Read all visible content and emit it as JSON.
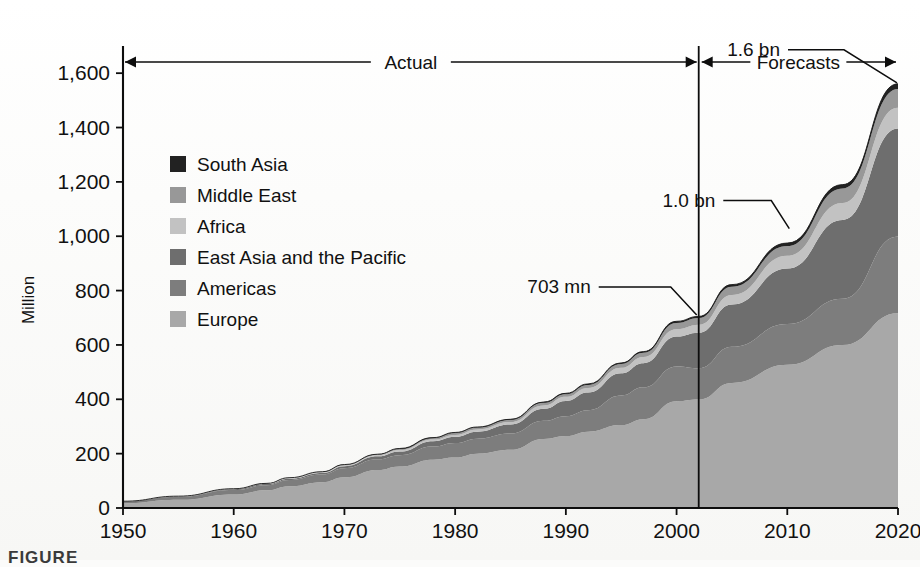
{
  "figure": {
    "caption": "FIGURE",
    "y_axis_title": "Million",
    "period_labels": {
      "actual": "Actual",
      "forecasts": "Forecasts"
    },
    "callouts": [
      {
        "name": "703 mn",
        "text": "703 mn",
        "year": 2002,
        "value": 703
      },
      {
        "name": "1.0 bn",
        "text": "1.0 bn",
        "year": 2010,
        "value": 1006
      },
      {
        "name": "1.6 bn",
        "text": "1.6 bn",
        "year": 2020,
        "value": 1561
      }
    ]
  },
  "chart_data": {
    "type": "area",
    "stacked": true,
    "title": "",
    "subtitle": "",
    "xlabel": "",
    "ylabel": "Million",
    "xlim": [
      1950,
      2020
    ],
    "ylim": [
      0,
      1700
    ],
    "ytick_labels": [
      "0",
      "200",
      "400",
      "600",
      "800",
      "1,000",
      "1,200",
      "1,400",
      "1,600"
    ],
    "ytick_values": [
      0,
      200,
      400,
      600,
      800,
      1000,
      1200,
      1400,
      1600
    ],
    "xtick_labels": [
      "1950",
      "1960",
      "1970",
      "1980",
      "1990",
      "2000",
      "2010",
      "2020"
    ],
    "xtick_values": [
      1950,
      1960,
      1970,
      1980,
      1990,
      2000,
      2010,
      2020
    ],
    "grid": false,
    "legend_position": "inside-upper-left",
    "forecast_divider_year": 2002,
    "annotations": [
      {
        "text": "Actual",
        "span": [
          1950,
          2002
        ]
      },
      {
        "text": "Forecasts",
        "span": [
          2002,
          2020
        ]
      },
      {
        "text": "703 mn",
        "at_year": 2002,
        "at_value": 703
      },
      {
        "text": "1.0 bn",
        "at_year": 2010,
        "at_value": 1006
      },
      {
        "text": "1.6 bn",
        "at_year": 2020,
        "at_value": 1561
      }
    ],
    "x": [
      1950,
      1955,
      1960,
      1963,
      1965,
      1968,
      1970,
      1973,
      1975,
      1978,
      1980,
      1982,
      1985,
      1988,
      1990,
      1992,
      1995,
      1997,
      2000,
      2002,
      2005,
      2010,
      2015,
      2020
    ],
    "series": [
      {
        "name": "Europe",
        "color": "#a8a8a8",
        "stack_order": 1,
        "values": [
          17,
          30,
          50,
          65,
          80,
          95,
          113,
          140,
          153,
          178,
          186,
          200,
          214,
          254,
          265,
          281,
          305,
          327,
          393,
          399,
          460,
          527,
          600,
          717
        ]
      },
      {
        "name": "Americas",
        "color": "#7d7d7d",
        "stack_order": 2,
        "values": [
          7,
          11,
          16,
          19,
          23,
          28,
          33,
          39,
          41,
          48,
          53,
          55,
          60,
          67,
          73,
          79,
          109,
          117,
          128,
          115,
          133,
          150,
          170,
          282
        ]
      },
      {
        "name": "East Asia and the Pacific",
        "color": "#6e6e6e",
        "stack_order": 3,
        "values": [
          0.2,
          1,
          3,
          4,
          5,
          6,
          8,
          11,
          14,
          20,
          23,
          26,
          33,
          44,
          56,
          65,
          82,
          89,
          110,
          131,
          156,
          204,
          290,
          397
        ]
      },
      {
        "name": "Africa",
        "color": "#c2c2c2",
        "stack_order": 4,
        "values": [
          0.5,
          1,
          1,
          1.5,
          2,
          2.5,
          3,
          4,
          5,
          6,
          7,
          8,
          9,
          12,
          15,
          17,
          20,
          23,
          27,
          29,
          35,
          47,
          62,
          77
        ]
      },
      {
        "name": "Middle East",
        "color": "#989898",
        "stack_order": 5,
        "values": [
          0.2,
          0.4,
          0.6,
          0.8,
          1,
          1.5,
          2,
          3,
          4,
          5,
          7,
          7,
          8,
          10,
          10,
          11,
          14,
          15,
          23,
          25,
          30,
          36,
          54,
          69
        ]
      },
      {
        "name": "South Asia",
        "color": "#222222",
        "stack_order": 6,
        "values": [
          0.1,
          0.2,
          0.3,
          0.4,
          0.5,
          0.6,
          0.8,
          1,
          2,
          2,
          2,
          2,
          2.5,
          3,
          3,
          3.5,
          4,
          4.5,
          6,
          6,
          8,
          11,
          14,
          19
        ]
      }
    ],
    "totals": [
      25,
      43.6,
      70.9,
      90.7,
      111.5,
      133.6,
      159.8,
      198,
      219,
      259,
      278,
      298,
      326.5,
      390,
      422,
      456.5,
      534,
      575.5,
      687,
      705,
      822,
      975,
      1190,
      1561
    ]
  },
  "legend": {
    "items": [
      {
        "label": "South Asia",
        "color": "#222222",
        "icon": "legend-swatch"
      },
      {
        "label": "Middle East",
        "color": "#989898",
        "icon": "legend-swatch"
      },
      {
        "label": "Africa",
        "color": "#c2c2c2",
        "icon": "legend-swatch"
      },
      {
        "label": "East Asia and the Pacific",
        "color": "#6e6e6e",
        "icon": "legend-swatch"
      },
      {
        "label": "Americas",
        "color": "#7d7d7d",
        "icon": "legend-swatch"
      },
      {
        "label": "Europe",
        "color": "#a8a8a8",
        "icon": "legend-swatch"
      }
    ]
  }
}
